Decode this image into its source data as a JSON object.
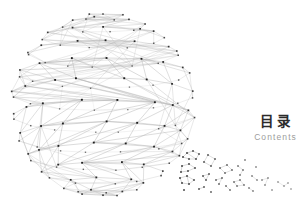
{
  "slide": {
    "width": 303,
    "height": 217,
    "background_color": "#ffffff"
  },
  "title_block": {
    "heading_cn": "目  录",
    "heading_en": "Contents",
    "heading_cn_color": "#2b2b2b",
    "heading_en_color": "#9d9d9d"
  },
  "globe": {
    "name": "wireframe-globe",
    "center_x": 103,
    "center_y": 105,
    "radius": 92,
    "node_color": "#1a1a1a",
    "edge_color": "#b4b4b4",
    "node_size": 1.7,
    "edge_width": 0.45,
    "latitude_bands": 13,
    "description": "low-poly triangulated sphere mesh, nodes compressed toward right limb"
  },
  "particle_field": {
    "name": "dissolving-particle-field",
    "dot_color": "#2a2a2a",
    "edge_color": "#8f8f8f",
    "region_x": [
      178,
      294
    ],
    "region_y": [
      148,
      196
    ],
    "clusters": [
      {
        "dots": [
          [
            187,
            153
          ],
          [
            193,
            151
          ],
          [
            199,
            154
          ],
          [
            196,
            159
          ],
          [
            189,
            159
          ],
          [
            183,
            157
          ]
        ],
        "links": [
          [
            0,
            1
          ],
          [
            1,
            2
          ],
          [
            2,
            3
          ],
          [
            3,
            4
          ],
          [
            4,
            5
          ],
          [
            5,
            0
          ],
          [
            0,
            3
          ]
        ]
      },
      {
        "dots": [
          [
            182,
            166
          ],
          [
            189,
            164
          ],
          [
            195,
            168
          ],
          [
            188,
            171
          ],
          [
            181,
            172
          ]
        ],
        "links": [
          [
            0,
            1
          ],
          [
            1,
            2
          ],
          [
            2,
            3
          ],
          [
            3,
            4
          ],
          [
            4,
            0
          ]
        ]
      },
      {
        "dots": [
          [
            180,
            178
          ],
          [
            187,
            176
          ],
          [
            194,
            180
          ],
          [
            189,
            184
          ],
          [
            182,
            183
          ]
        ],
        "links": [
          [
            0,
            1
          ],
          [
            1,
            2
          ],
          [
            2,
            3
          ],
          [
            3,
            4
          ],
          [
            4,
            0
          ],
          [
            1,
            3
          ]
        ]
      },
      {
        "dots": [
          [
            208,
            155
          ],
          [
            215,
            159
          ],
          [
            211,
            166
          ],
          [
            204,
            162
          ]
        ],
        "links": [
          [
            0,
            1
          ],
          [
            1,
            2
          ],
          [
            2,
            3
          ],
          [
            3,
            0
          ]
        ]
      },
      {
        "dots": [
          [
            220,
            168
          ],
          [
            227,
            165
          ],
          [
            232,
            170
          ],
          [
            225,
            173
          ]
        ],
        "links": [
          [
            0,
            1
          ],
          [
            1,
            2
          ],
          [
            2,
            3
          ],
          [
            3,
            0
          ]
        ]
      },
      {
        "dots": [
          [
            203,
            176
          ],
          [
            209,
            174
          ],
          [
            206,
            180
          ]
        ],
        "links": [
          [
            0,
            1
          ],
          [
            1,
            2
          ],
          [
            2,
            0
          ]
        ]
      },
      {
        "dots": [
          [
            216,
            180
          ],
          [
            222,
            178
          ],
          [
            219,
            184
          ]
        ],
        "links": [
          [
            0,
            1
          ],
          [
            1,
            2
          ]
        ]
      },
      {
        "dots": [
          [
            238,
            166
          ],
          [
            243,
            170
          ],
          [
            240,
            175
          ]
        ],
        "links": [
          [
            0,
            1
          ],
          [
            1,
            2
          ]
        ]
      },
      {
        "dots": [
          [
            234,
            182
          ],
          [
            240,
            180
          ],
          [
            244,
            185
          ],
          [
            237,
            186
          ]
        ],
        "links": [
          [
            0,
            1
          ],
          [
            1,
            2
          ],
          [
            2,
            3
          ],
          [
            3,
            0
          ]
        ]
      },
      {
        "dots": [
          [
            252,
            176
          ],
          [
            257,
            180
          ]
        ],
        "links": [
          [
            0,
            1
          ]
        ]
      },
      {
        "dots": [
          [
            262,
            180
          ],
          [
            268,
            178
          ],
          [
            265,
            185
          ]
        ],
        "links": [
          [
            0,
            1
          ],
          [
            1,
            2
          ]
        ]
      },
      {
        "dots": [
          [
            278,
            182
          ],
          [
            284,
            186
          ],
          [
            288,
            183
          ]
        ],
        "links": [
          [
            0,
            1
          ],
          [
            1,
            2
          ]
        ]
      },
      {
        "dots": [
          [
            230,
            190
          ],
          [
            226,
            186
          ]
        ],
        "links": [
          [
            0,
            1
          ]
        ]
      },
      {
        "dots": [
          [
            249,
            188
          ],
          [
            253,
            191
          ]
        ],
        "links": [
          [
            0,
            1
          ]
        ]
      },
      {
        "dots": [
          [
            199,
            189
          ],
          [
            204,
            187
          ]
        ],
        "links": [
          [
            0,
            1
          ]
        ]
      },
      {
        "dots": [
          [
            211,
            192
          ]
        ],
        "links": []
      },
      {
        "dots": [
          [
            272,
            190
          ]
        ],
        "links": []
      },
      {
        "dots": [
          [
            291,
            189
          ]
        ],
        "links": []
      },
      {
        "dots": [
          [
            184,
            190
          ]
        ],
        "links": []
      },
      {
        "dots": [
          [
            245,
            160
          ]
        ],
        "links": []
      },
      {
        "dots": [
          [
            256,
            167
          ]
        ],
        "links": []
      }
    ]
  }
}
